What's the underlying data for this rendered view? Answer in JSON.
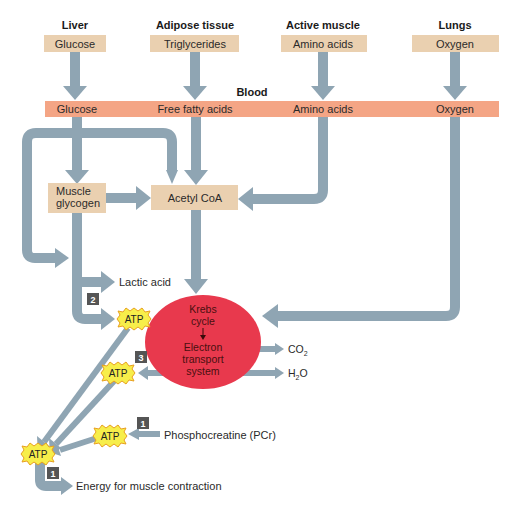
{
  "sources": [
    {
      "title": "Liver",
      "item": "Glucose"
    },
    {
      "title": "Adipose tissue",
      "item": "Triglycerides"
    },
    {
      "title": "Active muscle",
      "item": "Amino acids"
    },
    {
      "title": "Lungs",
      "item": "Oxygen"
    }
  ],
  "blood": {
    "label": "Blood",
    "items": [
      "Glucose",
      "Free fatty acids",
      "Amino acids",
      "Oxygen"
    ]
  },
  "intermediates": {
    "muscle_glycogen_line1": "Muscle",
    "muscle_glycogen_line2": "glycogen",
    "acetyl_coa": "Acetyl CoA"
  },
  "krebs": {
    "line1": "Krebs",
    "line2": "cycle",
    "line3": "Electron",
    "line4": "transport",
    "line5": "system"
  },
  "products": {
    "lactic_acid": "Lactic acid",
    "co2": "CO",
    "co2_sub": "2",
    "h2o_h": "H",
    "h2o_sub": "2",
    "h2o_o": "O",
    "phosphocreatine": "Phosphocreatine (PCr)",
    "energy": "Energy for muscle contraction"
  },
  "atp_label": "ATP",
  "badges": {
    "glycolysis": "2",
    "oxidative": "3",
    "pcr": "1",
    "energy": "1"
  },
  "colors": {
    "arrow": "#8fa5b3",
    "source_box": "#ead0b0",
    "blood_bar": "#f4a585",
    "krebs_ellipse": "#e8394d",
    "atp_star": "#f7ee4a",
    "atp_border": "#e8a020",
    "badge": "#555555"
  }
}
